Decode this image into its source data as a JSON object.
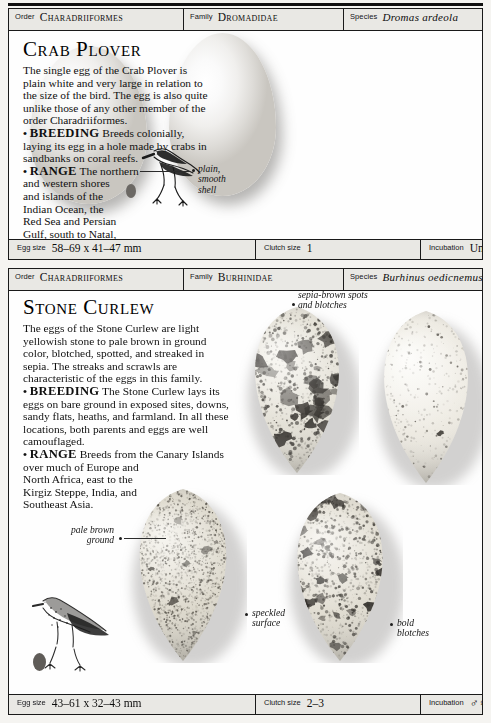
{
  "page": {
    "background_color": "#f5f4f1",
    "card_border_color": "#1a1a1a",
    "header_fill": "#e9e8e4"
  },
  "entries": [
    {
      "id": "crab-plover",
      "taxonomy": {
        "order_label": "Order",
        "order_value": "Charadriiformes",
        "family_label": "Family",
        "family_value": "Dromadidae",
        "species_label": "Species",
        "species_value": "Dromas ardeola"
      },
      "title": "Crab Plover",
      "description_paragraphs": [
        "The single egg of the Crab Plover is plain white and very large in relation to the size of the bird. The egg is also quite unlike those of any other member of the order Charadriiformes.",
        "BREEDING Breeds colonially, laying its egg in a hole made by crabs in sandbanks on coral reefs.",
        "RANGE The northern and western shores and islands of the Indian Ocean, the Red Sea and Persian Gulf, south to Natal, and east to India."
      ],
      "keywords": [
        "BREEDING",
        "RANGE"
      ],
      "annotations": [
        {
          "id": "plain-smooth-shell",
          "lines": [
            "plain,",
            "smooth",
            "shell"
          ]
        }
      ],
      "measurements": {
        "egg_size_label": "Egg size",
        "egg_size_value": "58–69 x 41–47 mm",
        "clutch_size_label": "Clutch size",
        "clutch_size_value": "1",
        "incubation_label": "Incubation",
        "incubation_value": "Unknown"
      },
      "eggs": [
        {
          "id": "crab-egg-left",
          "pattern": "plain-white"
        },
        {
          "id": "crab-egg-right",
          "pattern": "plain-white"
        }
      ],
      "bird_illustration": "crab-plover-bird"
    },
    {
      "id": "stone-curlew",
      "taxonomy": {
        "order_label": "Order",
        "order_value": "Charadriiformes",
        "family_label": "Family",
        "family_value": "Burhinidae",
        "species_label": "Species",
        "species_value": "Burhinus oedicnemus"
      },
      "title": "Stone Curlew",
      "description_paragraphs": [
        "The eggs of the Stone Curlew are light yellowish stone to pale brown in ground color, blotched, spotted, and streaked in sepia. The streaks and scrawls are characteristic of the eggs in this family.",
        "BREEDING The Stone Curlew lays its eggs on bare ground in exposed sites, downs, sandy flats, heaths, and farmland. In all these locations, both parents and eggs are well camouflaged.",
        "RANGE Breeds from the Canary Islands over much of Europe and North Africa, east to the Kirgiz Steppe, India, and Southeast Asia."
      ],
      "keywords": [
        "BREEDING",
        "RANGE"
      ],
      "annotations": [
        {
          "id": "sepia-brown-spots",
          "lines": [
            "sepia-brown spots",
            "and blotches"
          ]
        },
        {
          "id": "pale-brown-ground",
          "lines": [
            "pale brown",
            "ground"
          ]
        },
        {
          "id": "speckled-surface",
          "lines": [
            "speckled",
            "surface"
          ]
        },
        {
          "id": "bold-blotches",
          "lines": [
            "bold",
            "blotches"
          ]
        }
      ],
      "measurements": {
        "egg_size_label": "Egg size",
        "egg_size_value": "43–61 x 32–43 mm",
        "clutch_size_label": "Clutch size",
        "clutch_size_value": "2–3",
        "incubation_label": "Incubation",
        "incubation_value": "♂♀ 25–27 days"
      },
      "eggs": [
        {
          "id": "curlew-egg-top-left",
          "pattern": "heavy-blotched"
        },
        {
          "id": "curlew-egg-top-right",
          "pattern": "sparse-spotted"
        },
        {
          "id": "curlew-egg-bottom-left",
          "pattern": "fine-speckled"
        },
        {
          "id": "curlew-egg-bottom-right",
          "pattern": "bold-blotched"
        }
      ],
      "bird_illustration": "stone-curlew-bird"
    }
  ]
}
